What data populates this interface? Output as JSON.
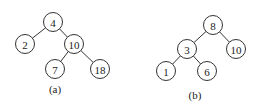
{
  "trees": [
    {
      "caption": "(a)",
      "caption_pos": [
        55,
        93
      ],
      "radius": 9.5,
      "nodes": [
        {
          "id": "a4",
          "label": "4",
          "x": 53,
          "y": 22
        },
        {
          "id": "a2",
          "label": "2",
          "x": 25,
          "y": 44
        },
        {
          "id": "a10",
          "label": "10",
          "x": 74,
          "y": 44
        },
        {
          "id": "a7",
          "label": "7",
          "x": 55,
          "y": 69
        },
        {
          "id": "a18",
          "label": "18",
          "x": 100,
          "y": 69
        }
      ],
      "edges": [
        [
          "a4",
          "a2"
        ],
        [
          "a4",
          "a10"
        ],
        [
          "a10",
          "a7"
        ],
        [
          "a10",
          "a18"
        ]
      ]
    },
    {
      "caption": "(b)",
      "caption_pos": [
        195,
        99
      ],
      "radius": 9.5,
      "nodes": [
        {
          "id": "b8",
          "label": "8",
          "x": 213,
          "y": 25
        },
        {
          "id": "b3",
          "label": "3",
          "x": 187,
          "y": 49
        },
        {
          "id": "b10",
          "label": "10",
          "x": 236,
          "y": 49
        },
        {
          "id": "b1",
          "label": "1",
          "x": 166,
          "y": 71
        },
        {
          "id": "b6",
          "label": "6",
          "x": 207,
          "y": 71
        }
      ],
      "edges": [
        [
          "b8",
          "b3"
        ],
        [
          "b8",
          "b10"
        ],
        [
          "b3",
          "b1"
        ],
        [
          "b3",
          "b6"
        ]
      ]
    }
  ]
}
